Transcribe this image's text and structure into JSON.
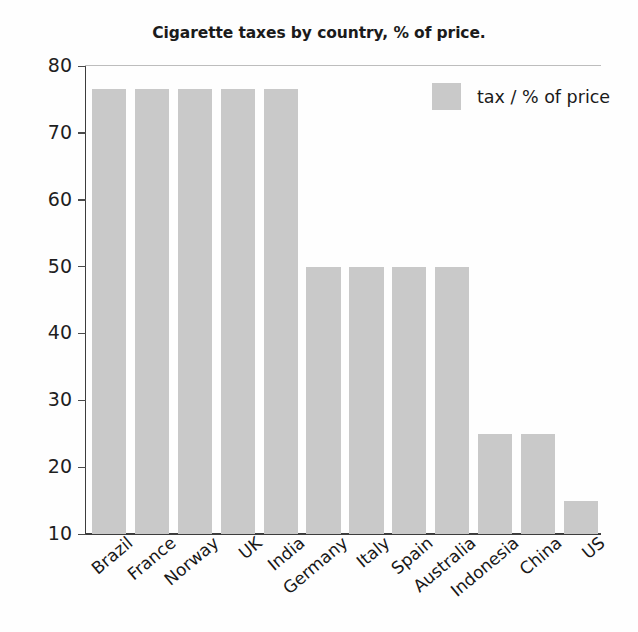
{
  "chart_data": {
    "type": "bar",
    "title": "Cigarette taxes by country, % of price.",
    "xlabel": "",
    "ylabel": "",
    "categories": [
      "Brazil",
      "France",
      "Norway",
      "UK",
      "India",
      "Germany",
      "Italy",
      "Spain",
      "Australia",
      "Indonesia",
      "China",
      "US"
    ],
    "values": [
      76.5,
      76.5,
      76.5,
      76.5,
      76.5,
      50,
      50,
      50,
      50,
      25,
      25,
      15
    ],
    "series": [
      {
        "name": "tax / % of price",
        "values": [
          76.5,
          76.5,
          76.5,
          76.5,
          76.5,
          50,
          50,
          50,
          50,
          25,
          25,
          15
        ],
        "color": "#c9c9c9"
      }
    ],
    "ylim": [
      10,
      80
    ],
    "yticks": [
      10,
      20,
      30,
      40,
      50,
      60,
      70,
      80
    ],
    "ytick_labels": [
      "10",
      "20",
      "30",
      "40",
      "50",
      "60",
      "70",
      "80"
    ],
    "grid": false,
    "gridline_top": true,
    "legend": {
      "position": "top-right",
      "entries": [
        {
          "label": "tax / % of price",
          "color": "#c9c9c9"
        }
      ]
    },
    "bar_color": "#c9c9c9",
    "axis_color": "#3d3d3d",
    "background": "#ffffff",
    "x_label_rotation_deg": -40
  }
}
